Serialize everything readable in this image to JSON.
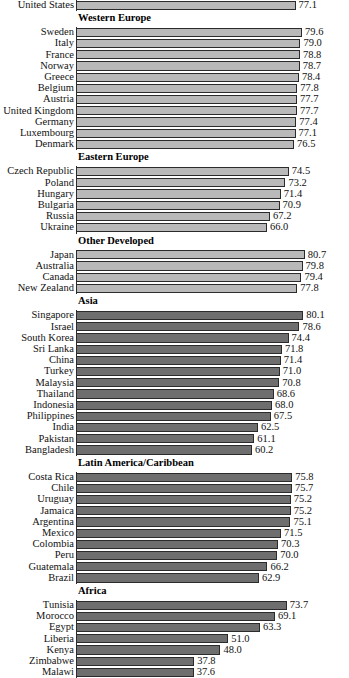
{
  "chart_data": {
    "type": "bar",
    "orientation": "horizontal",
    "title": "",
    "xlabel": "",
    "ylabel": "",
    "grid": false,
    "legend": null,
    "xlim": [
      -8,
      82
    ],
    "value_format": "one-decimal",
    "note": "Bar baseline is truncated; bars begin at a common left axis rather than at zero.",
    "groups": [
      {
        "name": "",
        "shade": "light",
        "categories": [
          "United States"
        ],
        "values": [
          77.1
        ]
      },
      {
        "name": "Western Europe",
        "shade": "light",
        "categories": [
          "Sweden",
          "Italy",
          "France",
          "Norway",
          "Greece",
          "Belgium",
          "Austria",
          "United Kingdom",
          "Germany",
          "Luxembourg",
          "Denmark"
        ],
        "values": [
          79.6,
          79.0,
          78.8,
          78.7,
          78.4,
          77.8,
          77.7,
          77.7,
          77.4,
          77.1,
          76.5
        ]
      },
      {
        "name": "Eastern Europe",
        "shade": "light",
        "categories": [
          "Czech Republic",
          "Poland",
          "Hungary",
          "Bulgaria",
          "Russia",
          "Ukraine"
        ],
        "values": [
          74.5,
          73.2,
          71.4,
          70.9,
          67.2,
          66.0
        ]
      },
      {
        "name": "Other Developed",
        "shade": "light",
        "categories": [
          "Japan",
          "Australia",
          "Canada",
          "New Zealand"
        ],
        "values": [
          80.7,
          79.8,
          79.4,
          77.8
        ]
      },
      {
        "name": "Asia",
        "shade": "dark",
        "categories": [
          "Singapore",
          "Israel",
          "South Korea",
          "Sri Lanka",
          "China",
          "Turkey",
          "Malaysia",
          "Thailand",
          "Indonesia",
          "Philippines",
          "India",
          "Pakistan",
          "Bangladesh"
        ],
        "values": [
          80.1,
          78.6,
          74.4,
          71.8,
          71.4,
          71.0,
          70.8,
          68.6,
          68.0,
          67.5,
          62.5,
          61.1,
          60.2
        ]
      },
      {
        "name": "Latin America/Caribbean",
        "shade": "dark",
        "categories": [
          "Costa Rica",
          "Chile",
          "Uruguay",
          "Jamaica",
          "Argentina",
          "Mexico",
          "Colombia",
          "Peru",
          "Guatemala",
          "Brazil"
        ],
        "values": [
          75.8,
          75.7,
          75.2,
          75.2,
          75.1,
          71.5,
          70.3,
          70.0,
          66.2,
          62.9
        ]
      },
      {
        "name": "Africa",
        "shade": "dark",
        "categories": [
          "Tunisia",
          "Morocco",
          "Egypt",
          "Liberia",
          "Kenya",
          "Zimbabwe",
          "Malawi"
        ],
        "values": [
          73.7,
          69.1,
          63.3,
          51.0,
          48.0,
          37.8,
          37.6
        ]
      }
    ]
  },
  "colors": {
    "bar_light": "#b9b9b9",
    "bar_dark": "#6e6e6e",
    "bar_outline": "#2b2b2b",
    "text": "#111111",
    "background": "#ffffff"
  },
  "layout": {
    "axis_x_px": 76,
    "px_per_unit": 2.58,
    "row_height_px": 11.2
  }
}
